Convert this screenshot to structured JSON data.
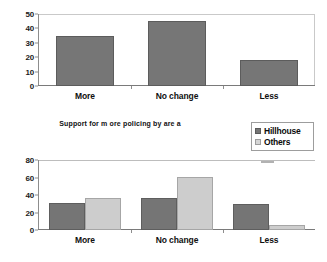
{
  "caption": "Support for m ore policing by are a",
  "legend": {
    "position": "right-of-caption",
    "items": [
      {
        "label": "Hillhouse",
        "color": "#757575",
        "icon": "legend-swatch"
      },
      {
        "label": "Others",
        "color": "#d6d6d6",
        "icon": "legend-swatch"
      }
    ]
  },
  "chart_data": [
    {
      "id": "top",
      "type": "bar",
      "title": "",
      "xlabel": "",
      "ylabel": "",
      "categories": [
        "More",
        "No change",
        "Less"
      ],
      "values": [
        35,
        45,
        18
      ],
      "series": [
        {
          "name": "All",
          "values": [
            35,
            45,
            18
          ]
        }
      ],
      "ylim": [
        0,
        50
      ],
      "yticks": [
        0,
        10,
        20,
        30,
        40,
        50
      ],
      "grid": false,
      "bar_color": "#767676"
    },
    {
      "id": "bottom",
      "type": "bar",
      "title": "",
      "xlabel": "",
      "ylabel": "",
      "categories": [
        "More",
        "No change",
        "Less"
      ],
      "series": [
        {
          "name": "Hillhouse",
          "values": [
            31,
            37,
            30
          ],
          "color": "#757575"
        },
        {
          "name": "Others",
          "values": [
            37,
            61,
            6
          ],
          "color": "#cdcdcd"
        }
      ],
      "ylim": [
        0,
        80
      ],
      "yticks": [
        0,
        20,
        40,
        60,
        80
      ],
      "grid": false
    }
  ]
}
